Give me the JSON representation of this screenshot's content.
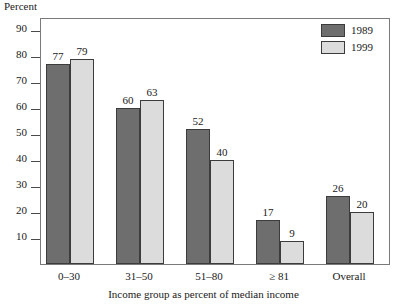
{
  "chart_data": {
    "type": "bar",
    "title": "",
    "subtitle": "",
    "xlabel": "Income group as percent of median income",
    "ylabel": "Percent",
    "categories": [
      "0–30",
      "31–50",
      "51–80",
      "≥ 81",
      "Overall"
    ],
    "series": [
      {
        "name": "1989",
        "color": "#6e6e6e",
        "values": [
          77,
          60,
          52,
          17,
          26
        ]
      },
      {
        "name": "1999",
        "color": "#dcdcdc",
        "values": [
          79,
          63,
          40,
          9,
          20
        ]
      }
    ],
    "ylim": [
      0,
      95
    ],
    "yticks": [
      10,
      20,
      30,
      40,
      50,
      60,
      70,
      80,
      90
    ],
    "ytick_labels": [
      "10",
      "20",
      "30",
      "40",
      "50",
      "60",
      "70",
      "80",
      "90"
    ],
    "grid": false,
    "legend_position": "top-right",
    "show_value_labels": true,
    "frame_color": "#7a7a7a",
    "bar_border_color": "#3c3c3c",
    "background": "#ffffff"
  },
  "legend": {
    "items": [
      {
        "label": "1989",
        "series": 0
      },
      {
        "label": "1999",
        "series": 1
      }
    ]
  }
}
